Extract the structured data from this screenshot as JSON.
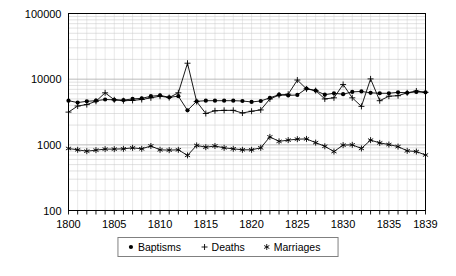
{
  "chart_data": {
    "type": "line",
    "title": "",
    "subtitle": "",
    "xlabel": "",
    "ylabel": "",
    "yscale": "log",
    "ylim": [
      100,
      100000
    ],
    "xlim": [
      1800,
      1839
    ],
    "grid": true,
    "legend_position": "bottom",
    "y_tick_labels": [
      "100000",
      "10000",
      "1000",
      "100"
    ],
    "y_tick_values": [
      100000,
      10000,
      1000,
      100
    ],
    "x_tick_labels": [
      "1800",
      "1805",
      "1810",
      "1815",
      "1820",
      "1825",
      "1830",
      "1835",
      "1839"
    ],
    "x_tick_values": [
      1800,
      1805,
      1810,
      1815,
      1820,
      1825,
      1830,
      1835,
      1839
    ],
    "x": [
      1800,
      1801,
      1802,
      1803,
      1804,
      1805,
      1806,
      1807,
      1808,
      1809,
      1810,
      1811,
      1812,
      1813,
      1814,
      1815,
      1816,
      1817,
      1818,
      1819,
      1820,
      1821,
      1822,
      1823,
      1824,
      1825,
      1826,
      1827,
      1828,
      1829,
      1830,
      1831,
      1832,
      1833,
      1834,
      1835,
      1836,
      1837,
      1838,
      1839
    ],
    "series": [
      {
        "name": "Baptisms",
        "marker": "dot",
        "values": [
          4700,
          4400,
          4600,
          4700,
          4900,
          4850,
          4800,
          5000,
          5100,
          5500,
          5650,
          5300,
          5500,
          3350,
          4600,
          4700,
          4700,
          4700,
          4700,
          4650,
          4500,
          4650,
          5200,
          5800,
          5650,
          5750,
          7200,
          6700,
          5800,
          6100,
          5900,
          6400,
          6500,
          6200,
          6100,
          6100,
          6300,
          6200,
          6400,
          6300
        ]
      },
      {
        "name": "Deaths",
        "marker": "plus",
        "values": [
          3150,
          3900,
          4100,
          4600,
          6200,
          4850,
          4700,
          4750,
          4900,
          5200,
          5500,
          5250,
          6200,
          17500,
          4550,
          3000,
          3300,
          3350,
          3350,
          3050,
          3250,
          3400,
          5000,
          5700,
          5900,
          9700,
          7100,
          6700,
          5000,
          5200,
          8300,
          5200,
          3850,
          10100,
          4700,
          5500,
          5600,
          6200,
          6600,
          6300
        ]
      },
      {
        "name": "Marriages",
        "marker": "star",
        "values": [
          880,
          840,
          800,
          830,
          860,
          860,
          870,
          900,
          870,
          960,
          840,
          830,
          840,
          690,
          980,
          920,
          960,
          900,
          870,
          840,
          840,
          900,
          1320,
          1130,
          1180,
          1220,
          1230,
          1080,
          950,
          790,
          990,
          1000,
          880,
          1180,
          1070,
          1010,
          940,
          810,
          790,
          700
        ]
      }
    ],
    "legend": [
      {
        "label": "Baptisms",
        "marker": "dot"
      },
      {
        "label": "Deaths",
        "marker": "plus"
      },
      {
        "label": "Marriages",
        "marker": "star"
      }
    ]
  },
  "colors": {
    "background": "#ffffff",
    "ink": "#000000",
    "grid_major": "#b4b4b4",
    "grid_minor": "#c8c8c8",
    "legend_border": "#808080"
  }
}
